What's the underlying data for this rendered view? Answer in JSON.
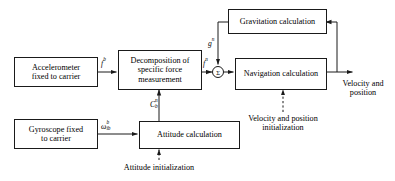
{
  "diagram": {
    "type": "block-diagram",
    "canvas": {
      "width": 395,
      "height": 181
    },
    "stroke_color": "#1a1a1a",
    "background_color": "#ffffff",
    "text_color": "#000000"
  },
  "blocks": {
    "accelerometer": {
      "line1": "Accelerometer",
      "line2": "fixed to carrier"
    },
    "gyroscope": {
      "line1": "Gyroscope fixed",
      "line2": "to carrier"
    },
    "decomposition": {
      "line1": "Decomposition of",
      "line2": "specific force",
      "line3": "measurement"
    },
    "attitude": {
      "label": "Attitude calculation"
    },
    "navigation": {
      "label": "Navigation calculation"
    },
    "gravitation": {
      "label": "Gravitation calculation"
    }
  },
  "signals": {
    "specific_force_body": {
      "symbol": "f",
      "superscript": "b",
      "subscript": "",
      "reading": "f^b"
    },
    "specific_force_nav": {
      "symbol": "f",
      "superscript": "n",
      "subscript": "",
      "reading": "f^n"
    },
    "gravity_nav": {
      "symbol": "g",
      "superscript": "n",
      "subscript": "",
      "reading": "g^n"
    },
    "dcm": {
      "symbol": "C",
      "superscript": "n",
      "subscript": "b",
      "reading": "C_b^n"
    },
    "angular_rate": {
      "symbol": "ω",
      "superscript": "b",
      "subscript": "ib",
      "reading": "omega_ib^b"
    },
    "sum_junction": {
      "symbol": "Σ",
      "name": "summing-junction"
    }
  },
  "annotations": {
    "attitude_init": {
      "text": "Attitude initialization"
    },
    "velocity_position_init": {
      "line1": "Velocity and position",
      "line2": "initialization"
    },
    "output": {
      "line1": "Velocity and",
      "line2": "position"
    }
  }
}
